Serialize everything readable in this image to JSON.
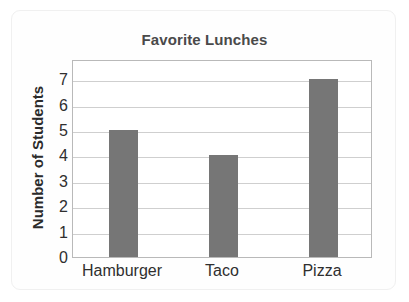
{
  "chart_data": {
    "type": "bar",
    "title": "Favorite Lunches",
    "xlabel": "",
    "ylabel": "Number of Students",
    "categories": [
      "Hamburger",
      "Taco",
      "Pizza"
    ],
    "values": [
      5,
      4,
      7
    ],
    "ylim": [
      0,
      7.8
    ],
    "yticks": [
      0,
      1,
      2,
      3,
      4,
      5,
      6,
      7
    ],
    "ytick_labels": [
      "0",
      "1",
      "2",
      "3",
      "4",
      "5",
      "6",
      "7"
    ],
    "grid": "horizontal",
    "legend": "none",
    "bar_color": "#767676",
    "title_color": "#4a4a4a",
    "gridline_color": "#cfcfcf",
    "axis_color": "#b9b9b9",
    "tick_label_color": "#2f2f2f",
    "background_color": "#ffffff"
  }
}
